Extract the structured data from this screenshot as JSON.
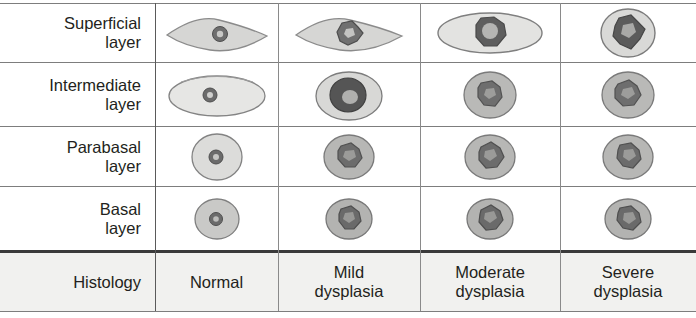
{
  "figure": {
    "kind": "histology-dysplasia-comparison-table",
    "row_label_column_header": "Histology"
  },
  "rows": [
    {
      "id": "superficial",
      "label_line1": "Superficial",
      "label_line2": "layer"
    },
    {
      "id": "intermediate",
      "label_line1": "Intermediate",
      "label_line2": "layer"
    },
    {
      "id": "parabasal",
      "label_line1": "Parabasal",
      "label_line2": "layer"
    },
    {
      "id": "basal",
      "label_line1": "Basal",
      "label_line2": "layer"
    }
  ],
  "columns": [
    {
      "id": "normal",
      "label_line1": "Normal",
      "label_line2": ""
    },
    {
      "id": "mild",
      "label_line1": "Mild",
      "label_line2": "dysplasia"
    },
    {
      "id": "moderate",
      "label_line1": "Moderate",
      "label_line2": "dysplasia"
    },
    {
      "id": "severe",
      "label_line1": "Severe",
      "label_line2": "dysplasia"
    }
  ],
  "cells": {
    "superficial": {
      "normal": {
        "cell_shape": "lens",
        "nucleus_shape": "round",
        "nucleus_size": "small",
        "cytoplasm_tone": "#d6d6d4",
        "nucleus_tone": "#6e6e6e"
      },
      "mild": {
        "cell_shape": "lens",
        "nucleus_shape": "irregular",
        "nucleus_size": "medium",
        "cytoplasm_tone": "#d6d6d4",
        "nucleus_tone": "#707070"
      },
      "moderate": {
        "cell_shape": "wide-ellipse",
        "nucleus_shape": "round-irregular",
        "nucleus_size": "large",
        "cytoplasm_tone": "#e3e3e1",
        "nucleus_tone": "#5e5e5e"
      },
      "severe": {
        "cell_shape": "circle",
        "nucleus_shape": "star-irregular",
        "nucleus_size": "large",
        "cytoplasm_tone": "#d9d9d7",
        "nucleus_tone": "#5b5b5b"
      }
    },
    "intermediate": {
      "normal": {
        "cell_shape": "wide-ellipse",
        "nucleus_shape": "round",
        "nucleus_size": "tiny",
        "cytoplasm_tone": "#e6e6e4",
        "nucleus_tone": "#6b6b6b"
      },
      "mild": {
        "cell_shape": "round-ellipse",
        "nucleus_shape": "round",
        "nucleus_size": "large",
        "cytoplasm_tone": "#d8d8d6",
        "nucleus_tone": "#555555"
      },
      "moderate": {
        "cell_shape": "circle",
        "nucleus_shape": "irregular",
        "nucleus_size": "medium",
        "cytoplasm_tone": "#b9b9b7",
        "nucleus_tone": "#6e6e6e"
      },
      "severe": {
        "cell_shape": "circle",
        "nucleus_shape": "irregular",
        "nucleus_size": "medium",
        "cytoplasm_tone": "#b9b9b7",
        "nucleus_tone": "#6e6e6e"
      }
    },
    "parabasal": {
      "normal": {
        "cell_shape": "circle",
        "nucleus_shape": "round",
        "nucleus_size": "small",
        "cytoplasm_tone": "#dcdcda",
        "nucleus_tone": "#6b6b6b"
      },
      "mild": {
        "cell_shape": "circle",
        "nucleus_shape": "irregular",
        "nucleus_size": "medium",
        "cytoplasm_tone": "#b7b7b5",
        "nucleus_tone": "#6c6c6c"
      },
      "moderate": {
        "cell_shape": "circle",
        "nucleus_shape": "irregular",
        "nucleus_size": "medium",
        "cytoplasm_tone": "#b7b7b5",
        "nucleus_tone": "#6c6c6c"
      },
      "severe": {
        "cell_shape": "circle",
        "nucleus_shape": "irregular",
        "nucleus_size": "medium",
        "cytoplasm_tone": "#b7b7b5",
        "nucleus_tone": "#6c6c6c"
      }
    },
    "basal": {
      "normal": {
        "cell_shape": "circle",
        "nucleus_shape": "round",
        "nucleus_size": "small",
        "cytoplasm_tone": "#c9c9c7",
        "nucleus_tone": "#6b6b6b"
      },
      "mild": {
        "cell_shape": "circle",
        "nucleus_shape": "irregular",
        "nucleus_size": "medium",
        "cytoplasm_tone": "#b3b3b1",
        "nucleus_tone": "#6a6a6a"
      },
      "moderate": {
        "cell_shape": "circle",
        "nucleus_shape": "irregular",
        "nucleus_size": "medium",
        "cytoplasm_tone": "#b3b3b1",
        "nucleus_tone": "#6a6a6a"
      },
      "severe": {
        "cell_shape": "circle",
        "nucleus_shape": "irregular",
        "nucleus_size": "medium",
        "cytoplasm_tone": "#b3b3b1",
        "nucleus_tone": "#6a6a6a"
      }
    }
  },
  "style": {
    "header_background": "#f1f1ef",
    "rule_color": "#7d7d7d",
    "thick_rule_color": "#3a3a3a",
    "text_color": "#231f20"
  }
}
